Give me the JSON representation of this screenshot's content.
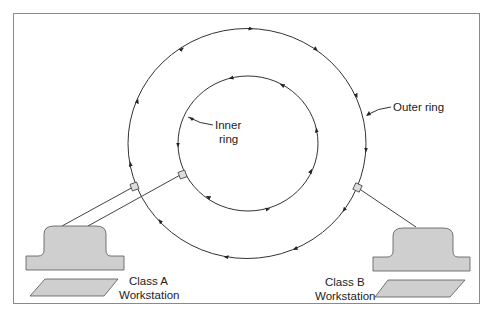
{
  "diagram": {
    "type": "dual-ring network topology",
    "labels": {
      "inner_ring_line1": "Inner",
      "inner_ring_line2": "ring",
      "outer_ring": "Outer ring",
      "class_a_line1": "Class A",
      "class_a_line2": "Workstation",
      "class_b_line1": "Class B",
      "class_b_line2": "Workstation"
    },
    "nodes": [
      {
        "id": "outer-ring",
        "shape": "circle",
        "direction": "clockwise"
      },
      {
        "id": "inner-ring",
        "shape": "circle",
        "direction": "counter-clockwise"
      },
      {
        "id": "class-a-workstation",
        "connects_to": [
          "outer-ring",
          "inner-ring"
        ]
      },
      {
        "id": "class-b-workstation",
        "connects_to": [
          "outer-ring"
        ]
      }
    ],
    "colors": {
      "line": "#333333",
      "device_fill": "#cfcfcf",
      "border": "#8a8a8a"
    }
  }
}
